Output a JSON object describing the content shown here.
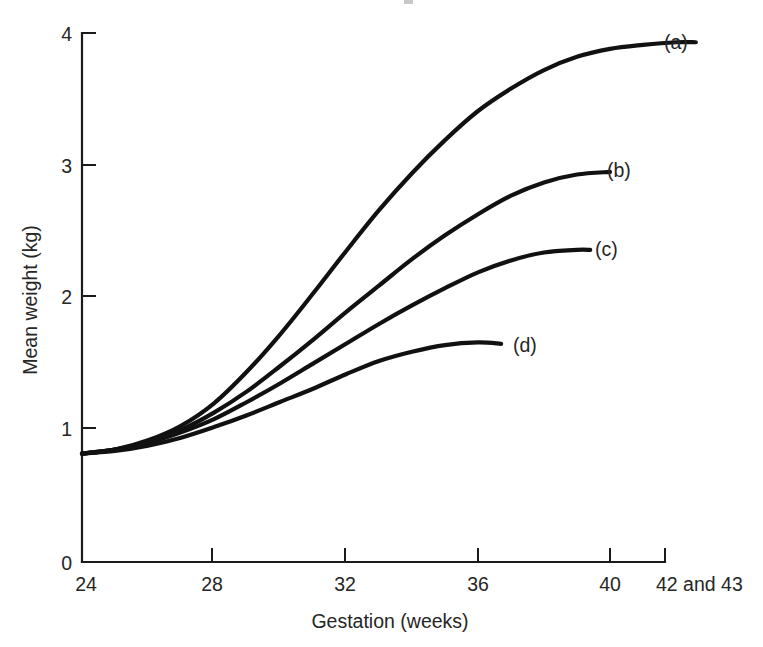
{
  "chart_data": {
    "type": "line",
    "title": "",
    "subtitle": "",
    "xlabel": "Gestation (weeks)",
    "ylabel": "Mean weight (kg)",
    "xlim": [
      24,
      43
    ],
    "ylim": [
      0,
      4
    ],
    "grid": false,
    "legend_position": "inline-right-of-curve-end",
    "x_ticks": [
      {
        "value": 24,
        "label": "24"
      },
      {
        "value": 28,
        "label": "28"
      },
      {
        "value": 32,
        "label": "32"
      },
      {
        "value": 36,
        "label": "36"
      },
      {
        "value": 40,
        "label": "40"
      },
      {
        "value": 42.6,
        "label": "42 and 43"
      }
    ],
    "y_ticks": [
      {
        "value": 0,
        "label": "0"
      },
      {
        "value": 1,
        "label": "1"
      },
      {
        "value": 2,
        "label": "2"
      },
      {
        "value": 3,
        "label": "3"
      },
      {
        "value": 4,
        "label": "4"
      }
    ],
    "series": [
      {
        "name": "(a)",
        "label": "(a)",
        "color": "#111111",
        "x": [
          24,
          25,
          26,
          27,
          28,
          29,
          30,
          31,
          32,
          33,
          34,
          35,
          36,
          37,
          38,
          39,
          40,
          41,
          42,
          42.6
        ],
        "values": [
          0.82,
          0.85,
          0.92,
          1.03,
          1.2,
          1.44,
          1.72,
          2.03,
          2.35,
          2.66,
          2.94,
          3.19,
          3.41,
          3.58,
          3.72,
          3.82,
          3.88,
          3.91,
          3.93,
          3.93
        ]
      },
      {
        "name": "(b)",
        "label": "(b)",
        "color": "#111111",
        "x": [
          24,
          25,
          26,
          27,
          28,
          29,
          30,
          31,
          32,
          33,
          34,
          35,
          36,
          37,
          38,
          39,
          40
        ],
        "values": [
          0.82,
          0.85,
          0.91,
          1.0,
          1.13,
          1.29,
          1.48,
          1.68,
          1.89,
          2.09,
          2.29,
          2.47,
          2.63,
          2.77,
          2.87,
          2.93,
          2.95
        ]
      },
      {
        "name": "(c)",
        "label": "(c)",
        "color": "#111111",
        "x": [
          24,
          25,
          26,
          27,
          28,
          29,
          30,
          31,
          32,
          33,
          34,
          35,
          36,
          37,
          38,
          39,
          39.4
        ],
        "values": [
          0.82,
          0.85,
          0.9,
          0.98,
          1.08,
          1.21,
          1.35,
          1.5,
          1.65,
          1.8,
          1.94,
          2.07,
          2.19,
          2.28,
          2.34,
          2.36,
          2.36
        ]
      },
      {
        "name": "(d)",
        "label": "(d)",
        "color": "#111111",
        "x": [
          24,
          25,
          26,
          27,
          28,
          29,
          30,
          31,
          32,
          33,
          34,
          35,
          36,
          36.7
        ],
        "values": [
          0.82,
          0.84,
          0.88,
          0.94,
          1.02,
          1.11,
          1.21,
          1.31,
          1.42,
          1.52,
          1.59,
          1.64,
          1.66,
          1.65
        ]
      }
    ]
  },
  "axes": {
    "y_axis_title": "Mean weight (kg)",
    "x_axis_title": "Gestation (weeks)"
  },
  "series_labels": {
    "a": "(a)",
    "b": "(b)",
    "c": "(c)",
    "d": "(d)"
  },
  "y_tick_labels": {
    "t0": "0",
    "t1": "1",
    "t2": "2",
    "t3": "3",
    "t4": "4"
  },
  "x_tick_labels": {
    "t24": "24",
    "t28": "28",
    "t32": "32",
    "t36": "36",
    "t40": "40",
    "t42": "42 and 43"
  },
  "style": {
    "curve_color": "#111111",
    "axis_color": "#1a1a1a",
    "text_color": "#262626",
    "background": "#ffffff"
  }
}
